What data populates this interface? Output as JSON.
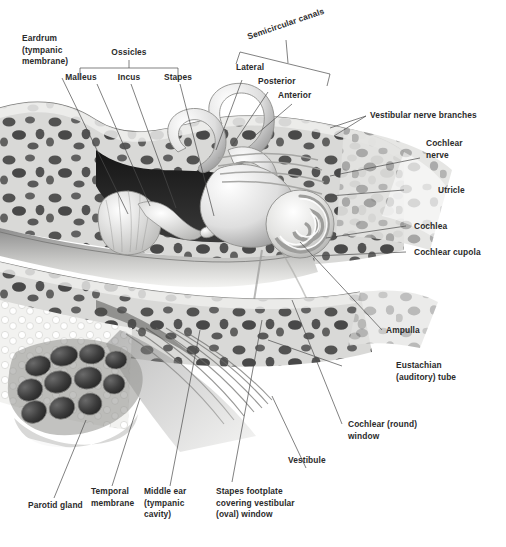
{
  "figure": {
    "kind": "anatomical-illustration",
    "style": "grayscale airbrush medical illustration",
    "background_color": "#ffffff",
    "label_color": "#2b2b2b",
    "leader_color": "#4a4a4a"
  },
  "brackets": [
    {
      "name": "ossicles",
      "title": "Ossicles",
      "members": [
        "Malleus",
        "Incus",
        "Stapes"
      ]
    },
    {
      "name": "semicircular-canals",
      "title": "Semicircular canals",
      "members": [
        "Lateral",
        "Posterior",
        "Anterior"
      ]
    }
  ],
  "labels": {
    "eardrum": "Eardrum\n(tympanic\nmembrane)",
    "ossicles": "Ossicles",
    "malleus": "Malleus",
    "incus": "Incus",
    "stapes": "Stapes",
    "semicircular_canals": "Semicircular canals",
    "lateral": "Lateral",
    "posterior": "Posterior",
    "anterior": "Anterior",
    "vestibular_nerve_branches": "Vestibular nerve branches",
    "cochlear_nerve": "Cochlear\nnerve",
    "utricle": "Utricle",
    "cochlea": "Cochlea",
    "cochlear_cupola": "Cochlear cupola",
    "ampulla": "Ampulla",
    "eustachian_tube": "Eustachian\n(auditory) tube",
    "cochlear_round_window": "Cochlear (round)\nwindow",
    "vestibule": "Vestibule",
    "stapes_footplate": "Stapes footplate\ncovering vestibular\n(oval) window",
    "middle_ear": "Middle ear\n(tympanic cavity)",
    "temporal_membrane": "Temporal\nmembrane",
    "parotid_gland": "Parotid gland"
  }
}
